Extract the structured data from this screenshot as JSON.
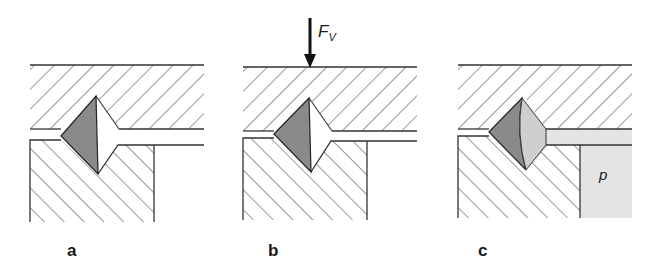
{
  "figure": {
    "panels": [
      {
        "id": "a",
        "label": "a",
        "state": "unloaded"
      },
      {
        "id": "b",
        "label": "b",
        "state": "axial-force",
        "force_label": "F",
        "force_subscript": "V"
      },
      {
        "id": "c",
        "label": "c",
        "state": "pressurized",
        "pressure_label": "p"
      }
    ],
    "colors": {
      "line": "#333333",
      "hatch": "#444444",
      "seal_dark": "#8a8a8a",
      "seal_light": "#cfcfcf",
      "fluid": "#e4e4e4",
      "background": "#ffffff"
    }
  }
}
